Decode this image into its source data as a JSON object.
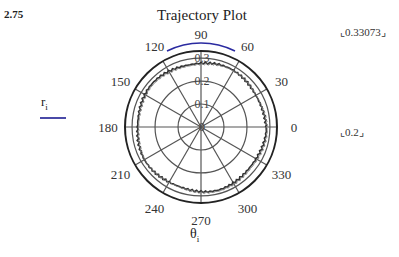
{
  "page_value": "2.75",
  "legend": {
    "label": "r",
    "subscript": "i",
    "line_color": "#4a4aa8"
  },
  "limits": {
    "max": "0.33073",
    "min": "0.2"
  },
  "chart_data": {
    "type": "polar",
    "title": "Trajectory Plot",
    "xlabel": "θ",
    "xlabel_sub": "i",
    "ylabel": "r",
    "ylabel_sub": "i",
    "radial_range": [
      0,
      0.33073
    ],
    "radial_ticks": [
      "0",
      "0.1",
      "0.2",
      "0.3"
    ],
    "angular_ticks": [
      "0",
      "30",
      "60",
      "90",
      "120",
      "150",
      "180",
      "210",
      "240",
      "270",
      "300",
      "330"
    ],
    "grid": true,
    "series": [
      {
        "name": "r_i",
        "description": "approximately circular trajectory, jagged",
        "approx_radius": 0.28,
        "radius_range": [
          0.27,
          0.29
        ]
      }
    ]
  }
}
